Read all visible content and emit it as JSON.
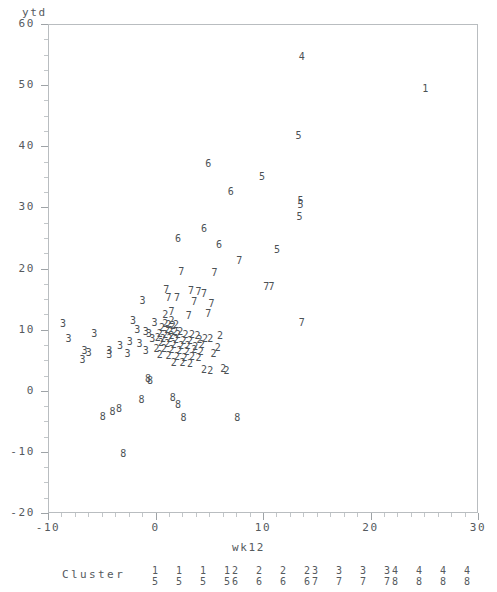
{
  "axes": {
    "y_title": "ytd",
    "x_title": "wk12",
    "y_ticks": [
      60,
      50,
      40,
      30,
      20,
      10,
      0,
      -10,
      -20
    ],
    "x_ticks": [
      -10,
      0,
      10,
      20,
      30
    ],
    "y_min": -20,
    "y_max": 60,
    "x_min": -10,
    "x_max": 30
  },
  "legend": {
    "title": "Cluster",
    "pairs": [
      {
        "top": "1",
        "bottom": "5"
      },
      {
        "top": "1",
        "bottom": "5"
      },
      {
        "top": "1",
        "bottom": "5"
      },
      {
        "top": "1",
        "bottom": "5"
      },
      {
        "top": "2",
        "bottom": "6"
      },
      {
        "top": "2",
        "bottom": "6"
      },
      {
        "top": "2",
        "bottom": "6"
      },
      {
        "top": "2",
        "bottom": "6"
      },
      {
        "top": "3",
        "bottom": "7"
      },
      {
        "top": "3",
        "bottom": "7"
      },
      {
        "top": "3",
        "bottom": "7"
      },
      {
        "top": "3",
        "bottom": "7"
      },
      {
        "top": "4",
        "bottom": "8"
      },
      {
        "top": "4",
        "bottom": "8"
      },
      {
        "top": "4",
        "bottom": "8"
      },
      {
        "top": "4",
        "bottom": "8"
      }
    ]
  },
  "chart_data": {
    "type": "scatter",
    "title": "",
    "xlabel": "wk12",
    "ylabel": "ytd",
    "xlim": [
      -10,
      30
    ],
    "ylim": [
      -20,
      60
    ],
    "grid": false,
    "legend_position": "below-axis",
    "marker_encoding": "cluster-number-as-glyph",
    "series": [
      {
        "name": "1",
        "label": "Cluster 1",
        "points": [
          [
            25.1,
            49.4
          ]
        ]
      },
      {
        "name": "4",
        "label": "Cluster 4",
        "points": [
          [
            13.6,
            54.6
          ]
        ]
      },
      {
        "name": "5",
        "label": "Cluster 5",
        "points": [
          [
            13.3,
            41.7
          ],
          [
            9.9,
            35.0
          ],
          [
            13.5,
            31.0
          ],
          [
            13.5,
            30.4
          ],
          [
            13.4,
            28.4
          ],
          [
            11.3,
            23.1
          ]
        ]
      },
      {
        "name": "6",
        "label": "Cluster 6",
        "points": [
          [
            4.9,
            37.1
          ],
          [
            7.0,
            32.6
          ],
          [
            4.5,
            26.5
          ],
          [
            2.1,
            24.8
          ],
          [
            5.9,
            23.8
          ]
        ]
      },
      {
        "name": "7",
        "label": "Cluster 7",
        "points": [
          [
            7.8,
            21.3
          ],
          [
            2.4,
            19.5
          ],
          [
            5.5,
            19.3
          ],
          [
            10.3,
            17.0
          ],
          [
            10.8,
            17.0
          ],
          [
            1.0,
            16.5
          ],
          [
            3.3,
            16.3
          ],
          [
            4.0,
            16.2
          ],
          [
            4.5,
            15.9
          ],
          [
            1.2,
            15.2
          ],
          [
            2.0,
            15.2
          ],
          [
            3.6,
            14.5
          ],
          [
            5.2,
            14.2
          ],
          [
            4.9,
            12.6
          ],
          [
            3.1,
            12.3
          ],
          [
            1.5,
            12.9
          ],
          [
            13.6,
            11.1
          ]
        ]
      },
      {
        "name": "3",
        "label": "Cluster 3",
        "points": [
          [
            -1.2,
            14.7
          ],
          [
            -8.6,
            11.0
          ],
          [
            -2.1,
            11.4
          ],
          [
            -0.1,
            11.1
          ],
          [
            -1.7,
            9.9
          ],
          [
            -0.9,
            9.6
          ],
          [
            -0.6,
            9.3
          ],
          [
            -5.7,
            9.3
          ],
          [
            -8.1,
            8.4
          ],
          [
            -0.3,
            8.5
          ],
          [
            -6.6,
            6.5
          ],
          [
            -6.2,
            6.2
          ],
          [
            -4.3,
            6.5
          ],
          [
            -4.3,
            5.8
          ],
          [
            -2.6,
            6.0
          ],
          [
            -1.5,
            7.6
          ],
          [
            -6.8,
            5.0
          ],
          [
            -2.4,
            8.0
          ],
          [
            -3.3,
            7.4
          ],
          [
            -0.9,
            6.5
          ]
        ]
      },
      {
        "name": "2",
        "label": "Cluster 2",
        "points": [
          [
            0.9,
            12.4
          ],
          [
            1.5,
            11.4
          ],
          [
            0.9,
            11.0
          ],
          [
            1.2,
            10.8
          ],
          [
            1.6,
            10.6
          ],
          [
            1.9,
            10.7
          ],
          [
            0.6,
            10.2
          ],
          [
            1.1,
            10.0
          ],
          [
            1.4,
            9.8
          ],
          [
            1.8,
            9.6
          ],
          [
            2.3,
            9.6
          ],
          [
            0.4,
            9.3
          ],
          [
            0.9,
            9.2
          ],
          [
            1.5,
            9.0
          ],
          [
            2.1,
            9.2
          ],
          [
            2.8,
            9.1
          ],
          [
            3.4,
            9.1
          ],
          [
            3.9,
            8.9
          ],
          [
            0.2,
            8.6
          ],
          [
            0.7,
            8.5
          ],
          [
            1.3,
            8.4
          ],
          [
            1.9,
            8.3
          ],
          [
            2.6,
            8.2
          ],
          [
            3.2,
            8.1
          ],
          [
            4.1,
            8.3
          ],
          [
            4.6,
            8.4
          ],
          [
            0.5,
            7.8
          ],
          [
            1.1,
            7.6
          ],
          [
            1.7,
            7.5
          ],
          [
            2.4,
            7.4
          ],
          [
            3.0,
            7.3
          ],
          [
            3.7,
            7.2
          ],
          [
            4.3,
            7.5
          ],
          [
            0.1,
            6.9
          ],
          [
            0.8,
            6.8
          ],
          [
            1.5,
            6.6
          ],
          [
            2.2,
            6.5
          ],
          [
            2.9,
            6.4
          ],
          [
            3.6,
            6.6
          ],
          [
            4.2,
            6.3
          ],
          [
            0.4,
            5.9
          ],
          [
            1.2,
            5.7
          ],
          [
            2.0,
            5.6
          ],
          [
            2.7,
            5.4
          ],
          [
            3.4,
            5.5
          ],
          [
            4.0,
            5.3
          ],
          [
            1.7,
            4.6
          ],
          [
            2.5,
            4.5
          ],
          [
            3.2,
            4.4
          ],
          [
            4.5,
            3.4
          ],
          [
            5.1,
            3.2
          ],
          [
            6.3,
            3.5
          ],
          [
            6.6,
            3.3
          ],
          [
            5.4,
            6.0
          ],
          [
            5.8,
            7.0
          ],
          [
            5.1,
            8.5
          ],
          [
            6.0,
            8.9
          ]
        ]
      },
      {
        "name": "8",
        "label": "Cluster 8",
        "points": [
          [
            -0.7,
            2.0
          ],
          [
            -0.5,
            1.6
          ],
          [
            -1.3,
            -1.5
          ],
          [
            1.6,
            -1.2
          ],
          [
            2.1,
            -2.3
          ],
          [
            -3.4,
            -3.0
          ],
          [
            -4.0,
            -3.4
          ],
          [
            -4.9,
            -4.3
          ],
          [
            2.6,
            -4.4
          ],
          [
            7.6,
            -4.5
          ],
          [
            -3.0,
            -10.3
          ]
        ]
      }
    ]
  }
}
